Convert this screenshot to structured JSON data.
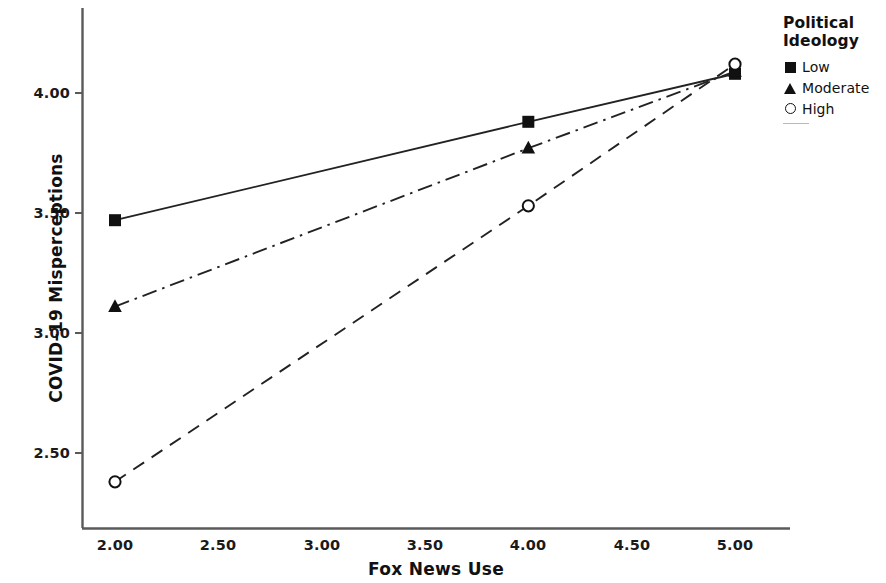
{
  "chart_data": {
    "type": "line",
    "title": "",
    "xlabel": "Fox News Use",
    "ylabel": "COVID-19 Misperceptions",
    "xlim": [
      1.72,
      5.22
    ],
    "ylim": [
      2.22,
      4.28
    ],
    "xticks": [
      "2.00",
      "2.50",
      "3.00",
      "3.50",
      "4.00",
      "4.50",
      "5.00"
    ],
    "xtick_values": [
      2.0,
      2.5,
      3.0,
      3.5,
      4.0,
      4.5,
      5.0
    ],
    "yticks": [
      "2.50",
      "3.00",
      "3.50",
      "4.00"
    ],
    "ytick_values": [
      2.5,
      3.0,
      3.5,
      4.0
    ],
    "grid": false,
    "legend_position": "right",
    "legend_title": "Political Ideology",
    "x": [
      2.0,
      4.0,
      5.0
    ],
    "series": [
      {
        "name": "Low",
        "marker": "filled-square",
        "linestyle": "solid",
        "values": [
          3.47,
          3.88,
          4.08
        ]
      },
      {
        "name": "Moderate",
        "marker": "filled-triangle",
        "linestyle": "dash-dot",
        "values": [
          3.11,
          3.77,
          4.09
        ]
      },
      {
        "name": "High",
        "marker": "open-circle",
        "linestyle": "dashed",
        "values": [
          2.38,
          3.53,
          4.12
        ]
      }
    ],
    "colors": {
      "line": "#222222",
      "marker": "#111111",
      "axis": "#555555",
      "text": "#111111"
    }
  },
  "legend": {
    "title_line_1": "Political",
    "title_line_2": "Ideology",
    "entries": [
      {
        "label": "Low",
        "marker": "filled-square"
      },
      {
        "label": "Moderate",
        "marker": "filled-triangle"
      },
      {
        "label": "High",
        "marker": "open-circle"
      }
    ]
  },
  "axes": {
    "x_title": "Fox News Use",
    "y_title": "COVID–19 Misperceptions",
    "x_tick_labels": [
      "2.00",
      "2.50",
      "3.00",
      "3.50",
      "4.00",
      "4.50",
      "5.00"
    ],
    "y_tick_labels": [
      "2.50",
      "3.00",
      "3.50",
      "4.00"
    ]
  }
}
